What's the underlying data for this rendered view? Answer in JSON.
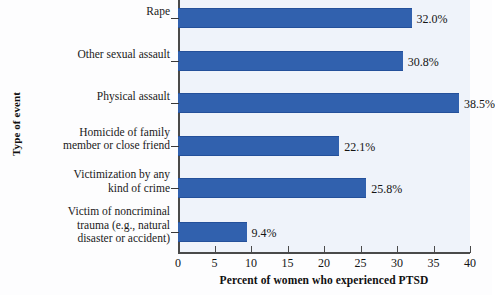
{
  "chart_data": {
    "type": "bar",
    "orientation": "horizontal",
    "title": "",
    "xlabel": "Percent of women who experienced PTSD",
    "ylabel": "Type of event",
    "xlim": [
      0,
      40
    ],
    "xticks": [
      "0",
      "5",
      "10",
      "15",
      "20",
      "25",
      "30",
      "35",
      "40"
    ],
    "xtick_values": [
      0,
      5,
      10,
      15,
      20,
      25,
      30,
      35,
      40
    ],
    "grid": false,
    "legend": false,
    "bar_color": "#3161ae",
    "plot_background": "#eff3fa",
    "categories": [
      "Rape",
      "Other sexual assault",
      "Physical assault",
      "Homicide of family member or close friend",
      "Victimization by any kind of crime",
      "Victim of noncriminal trauma (e.g., natural disaster or accident)"
    ],
    "category_lines": [
      [
        "Rape"
      ],
      [
        "Other sexual assault"
      ],
      [
        "Physical assault"
      ],
      [
        "Homicide of family",
        "member or close friend"
      ],
      [
        "Victimization by any",
        "kind of crime"
      ],
      [
        "Victim of noncriminal",
        "trauma (e.g., natural",
        "disaster or accident)"
      ]
    ],
    "values": [
      32.0,
      30.8,
      38.5,
      22.1,
      25.8,
      9.4
    ],
    "value_labels": [
      "32.0%",
      "30.8%",
      "38.5%",
      "22.1%",
      "25.8%",
      "9.4%"
    ]
  }
}
